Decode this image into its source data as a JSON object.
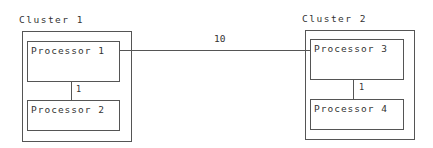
{
  "clusters": [
    {
      "label": "Cluster 1",
      "processors": [
        {
          "label": "Processor 1"
        },
        {
          "label": "Processor 2"
        }
      ],
      "internal_link_weight": "1"
    },
    {
      "label": "Cluster 2",
      "processors": [
        {
          "label": "Processor 3"
        },
        {
          "label": "Processor 4"
        }
      ],
      "internal_link_weight": "1"
    }
  ],
  "inter_cluster_link": {
    "from": "Processor 1",
    "to": "Processor 3",
    "weight": "10"
  },
  "colors": {
    "stroke": "#555555",
    "text": "#333333",
    "background": "#ffffff"
  }
}
